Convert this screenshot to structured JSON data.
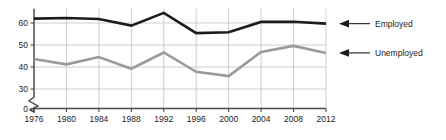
{
  "chart_data": {
    "type": "line",
    "title": "",
    "xlabel": "",
    "ylabel": "",
    "categories": [
      1976,
      1980,
      1984,
      1988,
      1992,
      1996,
      2000,
      2004,
      2008,
      2012
    ],
    "x_tick_labels": [
      "1976",
      "1980",
      "1984",
      "1988",
      "1992",
      "1996",
      "2000",
      "2004",
      "2008",
      "2012"
    ],
    "y_tick_labels": [
      "0",
      "30",
      "40",
      "50",
      "60"
    ],
    "y_tick_values": [
      0,
      30,
      40,
      50,
      60
    ],
    "ylim": [
      30,
      66
    ],
    "y_axis_break": true,
    "grid": true,
    "grid_axis": "both",
    "legend_position": "right-inline",
    "series": [
      {
        "name": "Employed",
        "color": "#1c1c1c",
        "line_width": 2.6,
        "values": [
          62,
          62.3,
          61.8,
          58.8,
          64.6,
          55.4,
          55.8,
          60.5,
          60.6,
          59.7
        ]
      },
      {
        "name": "Unemployed",
        "color": "#9a9a9a",
        "line_width": 2.6,
        "values": [
          43.6,
          41.2,
          44.5,
          39.2,
          46.6,
          37.8,
          35.9,
          46.8,
          49.6,
          46.4
        ]
      }
    ],
    "annotations": [
      {
        "label": "Employed",
        "target_series": "Employed",
        "arrow": "left-arrow"
      },
      {
        "label": "Unemployed",
        "target_series": "Unemployed",
        "arrow": "left-arrow"
      }
    ]
  },
  "legend": {
    "employed_label": "Employed",
    "unemployed_label": "Unemployed"
  },
  "colors": {
    "employed": "#1c1c1c",
    "unemployed": "#9a9a9a",
    "grid": "#b9b9b9",
    "axis": "#4a4a4a",
    "background": "#ffffff"
  }
}
